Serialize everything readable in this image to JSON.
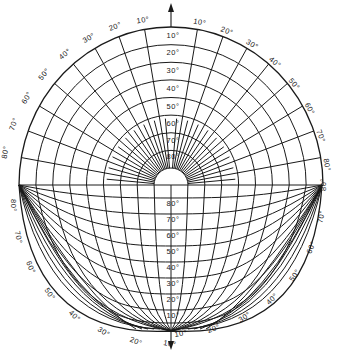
{
  "diagram": {
    "stroke_color": "#1a1a1a",
    "background": "#ffffff",
    "geometry": {
      "center": [
        171,
        185
      ],
      "outer_radius": 152,
      "top_y": 27,
      "left_point": [
        19,
        185
      ],
      "right_point": [
        322,
        185
      ],
      "bottom_apex": [
        171,
        331
      ]
    },
    "upper_ring_labels": [
      "10°",
      "20°",
      "30°",
      "40°",
      "50°",
      "60°",
      "70°",
      "80°"
    ],
    "upper_ring_label_y": [
      38,
      55,
      73,
      91,
      109,
      126,
      143,
      159
    ],
    "rim_labels_left_upper": [
      "10°",
      "20°",
      "30°",
      "40°",
      "50°",
      "60°",
      "70°",
      "80°"
    ],
    "rim_labels_right_upper": [
      "10°",
      "20°",
      "30°",
      "40°",
      "50°",
      "60°",
      "70°",
      "80°"
    ],
    "lower_row_labels": [
      "80°",
      "70°",
      "60°",
      "50°",
      "40°",
      "30°",
      "20°",
      "10°"
    ],
    "lower_row_label_y": [
      206,
      222,
      238,
      254,
      270,
      286,
      302,
      318
    ],
    "rim_labels_left_lower": [
      "80°",
      "70°",
      "60°",
      "50°",
      "40°",
      "30°",
      "20°",
      "10°"
    ],
    "rim_labels_right_lower": [
      "80°",
      "70°",
      "60°",
      "50°",
      "40°",
      "30°",
      "20°",
      "10°"
    ],
    "arrows": [
      {
        "name": "north-arrow",
        "direction": "up"
      },
      {
        "name": "south-arrow",
        "direction": "down"
      }
    ]
  }
}
